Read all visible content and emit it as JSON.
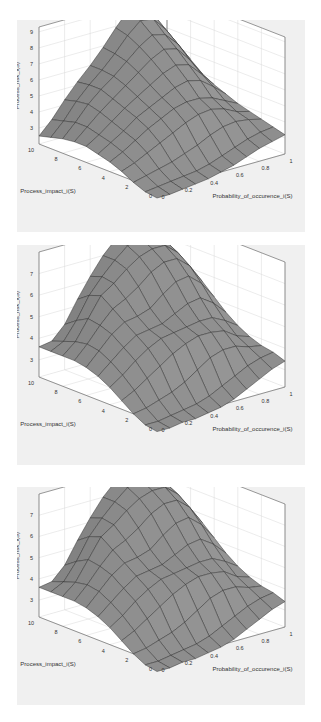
{
  "figure": {
    "background": "#ffffff",
    "panel_background": "#f0f0f0",
    "surface_color": "#8a8a8a",
    "edge_color": "#2a2a2a",
    "grid_color": "#d8d8d8"
  },
  "chart_data": [
    {
      "type": "surface3d",
      "title": "",
      "xlabel": "Probability_of_occurence_i(S)",
      "ylabel": "Process_impact_i(S)",
      "zlabel": "Process_risk_i(S)",
      "x_ticks": [
        "0",
        "0.2",
        "0.4",
        "0.6",
        "0.8",
        "1"
      ],
      "y_ticks": [
        "0",
        "2",
        "4",
        "6",
        "8",
        "10"
      ],
      "z_ticks": [
        "3",
        "4",
        "5",
        "6",
        "7",
        "8",
        "9"
      ],
      "xlim": [
        0,
        1
      ],
      "ylim": [
        0,
        10
      ],
      "zlim": [
        2,
        9.3
      ],
      "grid": true,
      "x": [
        0,
        0.1,
        0.2,
        0.3,
        0.4,
        0.5,
        0.6,
        0.7,
        0.8,
        0.9,
        1.0
      ],
      "y": [
        0,
        1,
        2,
        3,
        4,
        5,
        6,
        7,
        8,
        9,
        10
      ],
      "z": [
        [
          1.5,
          1.5,
          1.6,
          1.7,
          1.8,
          2.0,
          2.2,
          2.5,
          2.8,
          3.0,
          3.2
        ],
        [
          1.6,
          1.7,
          1.8,
          1.9,
          2.0,
          2.2,
          2.5,
          2.8,
          3.1,
          3.3,
          3.4
        ],
        [
          1.9,
          2.1,
          2.3,
          2.5,
          2.8,
          3.1,
          3.5,
          3.8,
          3.9,
          3.8,
          3.6
        ],
        [
          2.3,
          2.6,
          3.0,
          3.4,
          3.8,
          4.2,
          4.5,
          4.6,
          4.4,
          4.0,
          3.8
        ],
        [
          2.6,
          3.0,
          3.5,
          4.0,
          4.4,
          4.8,
          5.0,
          5.0,
          4.8,
          4.4,
          4.0
        ],
        [
          2.8,
          3.3,
          3.8,
          4.4,
          4.8,
          5.2,
          5.6,
          5.8,
          5.6,
          5.0,
          4.3
        ],
        [
          3.0,
          3.5,
          4.1,
          4.7,
          5.2,
          5.7,
          6.2,
          6.5,
          6.3,
          5.5,
          4.6
        ],
        [
          3.0,
          3.7,
          4.4,
          5.0,
          5.6,
          6.2,
          6.8,
          7.2,
          7.0,
          6.1,
          5.0
        ],
        [
          2.9,
          3.7,
          4.6,
          5.3,
          5.9,
          6.6,
          7.3,
          7.8,
          7.6,
          6.8,
          5.6
        ],
        [
          2.7,
          3.5,
          4.5,
          5.3,
          6.0,
          6.8,
          7.7,
          8.4,
          8.3,
          7.4,
          6.2
        ],
        [
          2.5,
          3.3,
          4.3,
          5.2,
          6.0,
          6.9,
          7.9,
          8.8,
          9.2,
          8.0,
          6.5
        ]
      ]
    },
    {
      "type": "surface3d",
      "title": "",
      "xlabel": "Probability_of_occurence_i(S)",
      "ylabel": "Process_impact_i(S)",
      "zlabel": "Process_risk_i(S)",
      "x_ticks": [
        "0",
        "0.2",
        "0.4",
        "0.6",
        "0.8",
        "1"
      ],
      "y_ticks": [
        "0",
        "2",
        "4",
        "6",
        "8",
        "10"
      ],
      "z_ticks": [
        "3",
        "4",
        "5",
        "6",
        "7"
      ],
      "xlim": [
        0,
        1
      ],
      "ylim": [
        0,
        10
      ],
      "zlim": [
        2.2,
        8.0
      ],
      "grid": true,
      "x": [
        0,
        0.1,
        0.2,
        0.3,
        0.4,
        0.5,
        0.6,
        0.7,
        0.8,
        0.9,
        1.0
      ],
      "y": [
        0,
        1,
        2,
        3,
        4,
        5,
        6,
        7,
        8,
        9,
        10
      ],
      "z": [
        [
          1.8,
          1.8,
          1.9,
          1.9,
          2.0,
          2.1,
          2.3,
          2.6,
          2.9,
          3.2,
          3.4
        ],
        [
          1.9,
          1.9,
          2.0,
          2.1,
          2.2,
          2.4,
          2.7,
          3.0,
          3.3,
          3.5,
          3.6
        ],
        [
          2.2,
          2.3,
          2.5,
          2.7,
          3.0,
          3.4,
          3.8,
          4.0,
          4.0,
          3.8,
          3.7
        ],
        [
          2.6,
          2.9,
          3.3,
          3.7,
          4.1,
          4.4,
          4.6,
          4.6,
          4.5,
          4.1,
          3.9
        ],
        [
          3.0,
          3.4,
          3.9,
          4.3,
          4.6,
          4.7,
          4.8,
          4.9,
          4.9,
          4.6,
          4.2
        ],
        [
          3.3,
          3.8,
          4.3,
          4.7,
          4.8,
          4.9,
          5.2,
          5.5,
          5.6,
          5.2,
          4.6
        ],
        [
          3.5,
          4.1,
          4.7,
          5.1,
          5.2,
          5.4,
          5.9,
          6.3,
          6.4,
          5.9,
          5.1
        ],
        [
          3.6,
          4.2,
          4.9,
          5.5,
          5.8,
          6.2,
          6.7,
          7.0,
          7.0,
          6.5,
          5.6
        ],
        [
          3.6,
          4.1,
          5.0,
          5.9,
          6.3,
          6.8,
          7.2,
          7.4,
          7.4,
          6.9,
          6.0
        ],
        [
          3.6,
          3.9,
          4.7,
          5.7,
          6.4,
          7.0,
          7.5,
          7.7,
          7.7,
          7.2,
          6.3
        ],
        [
          3.6,
          3.7,
          4.3,
          5.3,
          6.2,
          7.0,
          7.6,
          7.9,
          7.9,
          7.4,
          6.5
        ]
      ]
    },
    {
      "type": "surface3d",
      "title": "",
      "xlabel": "Probability_of_occurence_i(S)",
      "ylabel": "Process_impact_i(S)",
      "zlabel": "Process_risk_i(S)",
      "x_ticks": [
        "0",
        "0.2",
        "0.4",
        "0.6",
        "0.8",
        "1"
      ],
      "y_ticks": [
        "0",
        "2",
        "4",
        "6",
        "8",
        "10"
      ],
      "z_ticks": [
        "3",
        "4",
        "5",
        "6",
        "7"
      ],
      "xlim": [
        0,
        1
      ],
      "ylim": [
        0,
        10
      ],
      "zlim": [
        2.2,
        8.0
      ],
      "grid": true,
      "x": [
        0,
        0.1,
        0.2,
        0.3,
        0.4,
        0.5,
        0.6,
        0.7,
        0.8,
        0.9,
        1.0
      ],
      "y": [
        0,
        1,
        2,
        3,
        4,
        5,
        6,
        7,
        8,
        9,
        10
      ],
      "z": [
        [
          1.8,
          1.8,
          1.9,
          1.9,
          2.0,
          2.1,
          2.3,
          2.6,
          2.9,
          3.2,
          3.4
        ],
        [
          1.9,
          1.9,
          2.0,
          2.1,
          2.2,
          2.4,
          2.7,
          3.0,
          3.3,
          3.5,
          3.6
        ],
        [
          2.2,
          2.3,
          2.5,
          2.7,
          3.0,
          3.4,
          3.8,
          4.0,
          4.0,
          3.8,
          3.7
        ],
        [
          2.6,
          2.9,
          3.3,
          3.7,
          4.1,
          4.4,
          4.6,
          4.6,
          4.5,
          4.1,
          3.9
        ],
        [
          3.0,
          3.4,
          3.9,
          4.3,
          4.6,
          4.7,
          4.8,
          4.9,
          4.9,
          4.6,
          4.2
        ],
        [
          3.3,
          3.8,
          4.3,
          4.7,
          4.8,
          4.9,
          5.2,
          5.5,
          5.6,
          5.2,
          4.6
        ],
        [
          3.5,
          4.1,
          4.7,
          5.1,
          5.2,
          5.4,
          5.9,
          6.3,
          6.4,
          5.9,
          5.1
        ],
        [
          3.6,
          4.2,
          4.9,
          5.5,
          5.8,
          6.2,
          6.7,
          7.0,
          7.0,
          6.5,
          5.6
        ],
        [
          3.6,
          4.1,
          5.0,
          5.9,
          6.3,
          6.8,
          7.2,
          7.4,
          7.4,
          6.9,
          6.0
        ],
        [
          3.6,
          3.9,
          4.7,
          5.7,
          6.4,
          7.0,
          7.5,
          7.7,
          7.7,
          7.2,
          6.3
        ],
        [
          3.6,
          3.7,
          4.3,
          5.3,
          6.2,
          7.0,
          7.6,
          7.9,
          7.9,
          7.4,
          6.5
        ]
      ]
    }
  ],
  "panels": [
    {
      "top": 20,
      "height": 212
    },
    {
      "top": 245,
      "height": 220
    },
    {
      "top": 487,
      "height": 218
    }
  ]
}
